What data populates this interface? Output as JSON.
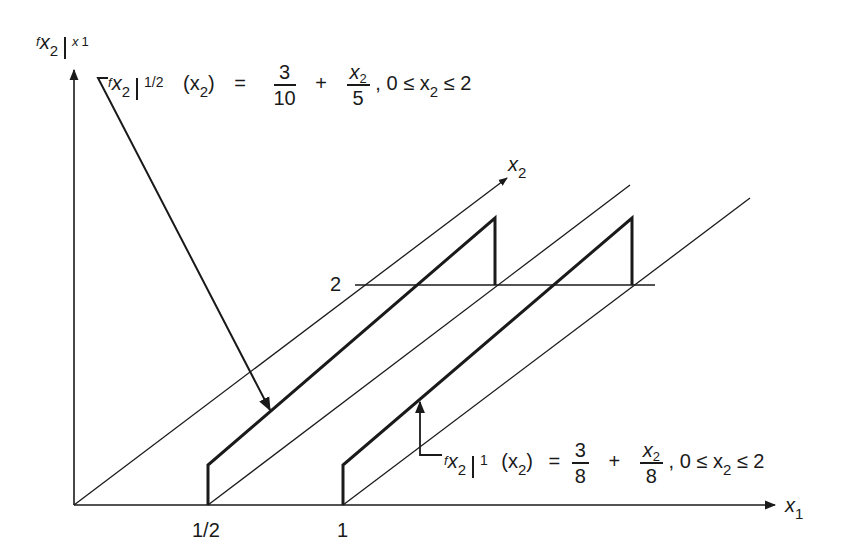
{
  "diagram": {
    "type": "3d-axes-conditional-density-plot",
    "colors": {
      "ink": "#1a1a1a",
      "background": "#ffffff"
    },
    "axes": {
      "vertical_label": {
        "f": "f",
        "sub": "x",
        "sub2": "2",
        "cond": "x",
        "cond_sub": "1"
      },
      "x1_label": {
        "var": "x",
        "sub": "1"
      },
      "x2_label": {
        "var": "x",
        "sub": "2"
      }
    },
    "ticks": {
      "x1": [
        "1/2",
        "1"
      ],
      "x2": [
        "2"
      ]
    },
    "annotations": [
      {
        "id": "density-half",
        "f": "f",
        "sub_var": "x",
        "sub_idx": "2",
        "cond": "1/2",
        "arg": "(x",
        "arg_sub": "2",
        "arg_close": ")",
        "eq": "=",
        "term1_num": "3",
        "term1_den": "10",
        "plus": "+",
        "term2_num": "x",
        "term2_num_sub": "2",
        "term2_den": "5",
        "range": ", 0 ≤ x",
        "range_sub": "2",
        "range_end": "≤  2"
      },
      {
        "id": "density-one",
        "f": "f",
        "sub_var": "x",
        "sub_idx": "2",
        "cond": "1",
        "arg": "(x",
        "arg_sub": "2",
        "arg_close": ")",
        "eq": "=",
        "term1_num": "3",
        "term1_den": "8",
        "plus": "+",
        "term2_num": "x",
        "term2_num_sub": "2",
        "term2_den": "8",
        "range": ", 0 ≤ x",
        "range_sub": "2",
        "range_end": "≤ 2"
      }
    ]
  }
}
